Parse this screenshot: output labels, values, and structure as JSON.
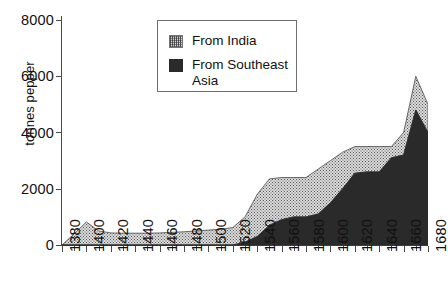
{
  "chart_data": {
    "type": "area",
    "stacked": true,
    "title": "",
    "xlabel": "",
    "ylabel": "tonnes pepper",
    "xlim": [
      1380,
      1680
    ],
    "ylim": [
      0,
      8000
    ],
    "ytick_labels": [
      "8000",
      "6000",
      "4000",
      "2000",
      "0"
    ],
    "ytick_values": [
      8000,
      6000,
      4000,
      2000,
      0
    ],
    "ytick_step": 2000,
    "xtick_labels": [
      "1380",
      "1400",
      "1420",
      "1440",
      "1460",
      "1480",
      "1500",
      "1520",
      "1540",
      "1560",
      "1580",
      "1600",
      "1620",
      "1640",
      "1660",
      "1680"
    ],
    "xtick_values": [
      1380,
      1400,
      1420,
      1440,
      1460,
      1480,
      1500,
      1520,
      1540,
      1560,
      1580,
      1600,
      1620,
      1640,
      1660,
      1680
    ],
    "xminor_step": 10,
    "grid": false,
    "legend_position": "top-center",
    "x": [
      1380,
      1390,
      1400,
      1410,
      1420,
      1430,
      1440,
      1450,
      1460,
      1470,
      1480,
      1490,
      1500,
      1510,
      1520,
      1530,
      1540,
      1550,
      1560,
      1570,
      1580,
      1590,
      1600,
      1610,
      1620,
      1630,
      1640,
      1650,
      1660,
      1670,
      1680
    ],
    "series": [
      {
        "name": "From Southeast Asia",
        "color": "#2a2a2a",
        "values": [
          0,
          0,
          0,
          0,
          0,
          0,
          0,
          0,
          0,
          0,
          0,
          0,
          0,
          0,
          0,
          100,
          300,
          700,
          900,
          1000,
          1000,
          1100,
          1500,
          2000,
          2550,
          2600,
          2600,
          3100,
          3200,
          4800,
          4000
        ]
      },
      {
        "name": "From India",
        "color": "#d6d6d6",
        "values": [
          0,
          400,
          820,
          500,
          430,
          420,
          420,
          420,
          430,
          450,
          470,
          500,
          530,
          560,
          620,
          900,
          1500,
          1650,
          1500,
          1400,
          1400,
          1600,
          1500,
          1300,
          950,
          900,
          900,
          400,
          800,
          1200,
          1000
        ]
      }
    ],
    "totals": [
      0,
      400,
      820,
      500,
      430,
      420,
      420,
      420,
      430,
      450,
      470,
      500,
      530,
      560,
      620,
      1000,
      1800,
      2350,
      2400,
      2400,
      2400,
      2700,
      3000,
      3300,
      3500,
      3500,
      3500,
      3500,
      4000,
      6000,
      5000
    ]
  },
  "legend": {
    "items": [
      {
        "label": "From India",
        "swatch": "hatched-light-gray"
      },
      {
        "label": "From Southeast Asia",
        "swatch": "solid-dark"
      }
    ]
  }
}
